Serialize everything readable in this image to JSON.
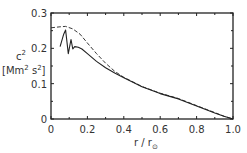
{
  "chart_data": {
    "type": "line",
    "title": "",
    "xlabel": "r / r⊙",
    "ylabel": "c² [Mm² s⁻²]",
    "xlim": [
      0,
      1.0
    ],
    "ylim": [
      0,
      0.3
    ],
    "grid": false,
    "legend": null,
    "x_ticks": [
      "0",
      "0.2",
      "0.4",
      "0.6",
      "0.8",
      "1.0"
    ],
    "y_ticks": [
      "0",
      "0.1",
      "0.2",
      "0.3"
    ],
    "series": [
      {
        "name": "dashed",
        "style": "dashed",
        "x": [
          0.0,
          0.05,
          0.08,
          0.12,
          0.16,
          0.2,
          0.25,
          0.3,
          0.35,
          0.4,
          0.5,
          0.6,
          0.7,
          0.8,
          0.9,
          0.95,
          1.0
        ],
        "y": [
          0.258,
          0.261,
          0.262,
          0.255,
          0.24,
          0.215,
          0.185,
          0.158,
          0.135,
          0.118,
          0.092,
          0.073,
          0.058,
          0.038,
          0.018,
          0.008,
          0.0
        ]
      },
      {
        "name": "solid",
        "style": "solid",
        "x": [
          0.05,
          0.07,
          0.08,
          0.095,
          0.11,
          0.12,
          0.13,
          0.15,
          0.17,
          0.2,
          0.25,
          0.3,
          0.35,
          0.4,
          0.5,
          0.6,
          0.7,
          0.8,
          0.9,
          0.95,
          1.0
        ],
        "y": [
          0.205,
          0.24,
          0.252,
          0.185,
          0.225,
          0.198,
          0.205,
          0.203,
          0.198,
          0.185,
          0.163,
          0.145,
          0.13,
          0.117,
          0.091,
          0.072,
          0.057,
          0.037,
          0.017,
          0.008,
          0.0
        ]
      }
    ]
  },
  "labels": {
    "y_var": "c",
    "y_sup": "2",
    "y_unit_open": "[Mm",
    "y_unit_sup1": "2",
    "y_unit_mid": " s",
    "y_unit_sup2": "2",
    "y_unit_close": "]",
    "x_title": "r / r",
    "x_sub": "⊙"
  }
}
